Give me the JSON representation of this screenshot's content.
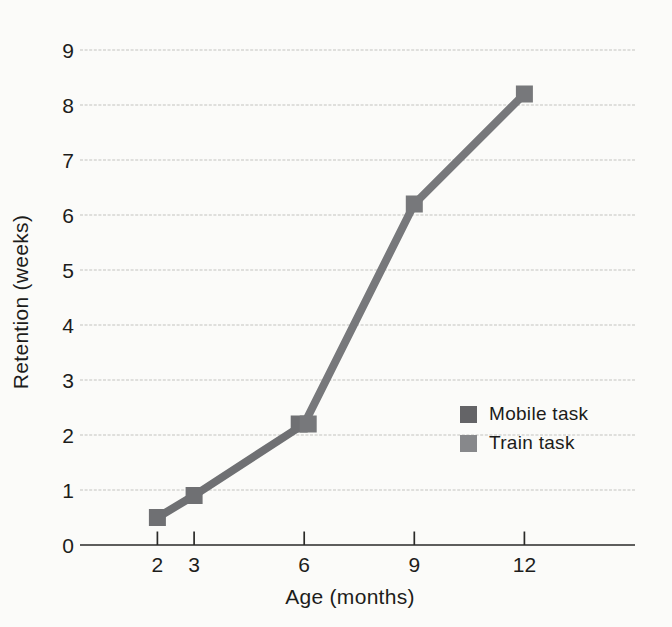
{
  "colors": {
    "background": "#fbfbf9",
    "text": "#1d1d1b",
    "axis": "#2a2a28",
    "gridline": "#c3c3c0"
  },
  "chart_data": {
    "type": "line",
    "title": "",
    "xlabel": "Age (months)",
    "ylabel": "Retention (weeks)",
    "x_ticks": [
      2,
      3,
      6,
      9,
      12
    ],
    "y_ticks": [
      0,
      1,
      2,
      3,
      4,
      5,
      6,
      7,
      8,
      9
    ],
    "xlim": [
      0,
      15
    ],
    "ylim": [
      0,
      9
    ],
    "grid": "horizontal-only",
    "legend_position": "lower-right",
    "marker": "square",
    "series": [
      {
        "name": "Mobile task",
        "color": "#6f7073",
        "points": [
          {
            "x": 2,
            "y": 0.5
          },
          {
            "x": 3,
            "y": 0.9
          },
          {
            "x": 6,
            "y": 2.2,
            "dx": -5
          }
        ]
      },
      {
        "name": "Train task",
        "color": "#77787b",
        "points": [
          {
            "x": 6,
            "y": 2.2,
            "dx": 4
          },
          {
            "x": 9,
            "y": 6.2
          },
          {
            "x": 12,
            "y": 8.2
          }
        ]
      }
    ],
    "legend": [
      {
        "label": "Mobile task",
        "swatch_color": "#646467"
      },
      {
        "label": "Train task",
        "swatch_color": "#87888b"
      }
    ]
  }
}
